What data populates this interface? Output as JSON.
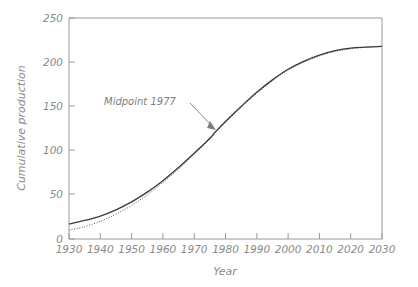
{
  "chart_data": {
    "type": "line",
    "title": "",
    "xlabel": "Year",
    "ylabel": "Cumulative production",
    "xlim": [
      1930,
      2030
    ],
    "ylim": [
      0,
      250
    ],
    "grid": false,
    "legend": "none",
    "xticks": [
      1930,
      1940,
      1950,
      1960,
      1970,
      1980,
      1990,
      2000,
      2010,
      2020,
      2030
    ],
    "xtick_labels": [
      "1930",
      "1940",
      "1950",
      "1960",
      "1970",
      "1980",
      "1990",
      "2000",
      "2010",
      "2020",
      "2030"
    ],
    "yticks": [
      0,
      50,
      100,
      150,
      200,
      250
    ],
    "ytick_labels": [
      "0",
      "50",
      "100",
      "150",
      "200",
      "250"
    ],
    "x": [
      1930,
      1935,
      1940,
      1945,
      1950,
      1955,
      1960,
      1965,
      1970,
      1975,
      1977,
      1980,
      1985,
      1990,
      1995,
      2000,
      2005,
      2010,
      2015,
      2020,
      2025,
      2030
    ],
    "series": [
      {
        "name": "cumulative-production-solid",
        "style": "solid",
        "color": "#3a3a3a",
        "values": [
          17,
          21,
          26,
          33,
          42,
          53,
          66,
          81,
          97,
          114,
          122,
          133,
          150,
          166,
          180,
          192,
          201,
          208,
          213,
          216,
          217,
          218
        ]
      },
      {
        "name": "cumulative-production-dotted",
        "style": "dotted",
        "color": "#5a5a5a",
        "values": [
          10,
          14,
          20,
          28,
          38,
          50,
          64,
          79,
          96,
          113,
          121,
          132,
          149,
          165,
          179,
          191,
          200,
          207,
          212,
          215,
          217,
          218
        ]
      }
    ],
    "annotations": [
      {
        "text": "Midpoint 1977",
        "point_x": 1977,
        "point_y": 122,
        "arrow": true
      }
    ],
    "colors": {
      "background": "#ffffff",
      "axis": "#9a9a9a",
      "text": "#8a8a8a",
      "solid_line": "#3a3a3a",
      "dotted_line": "#5a5a5a",
      "annotation": "#7d7d7d"
    }
  }
}
